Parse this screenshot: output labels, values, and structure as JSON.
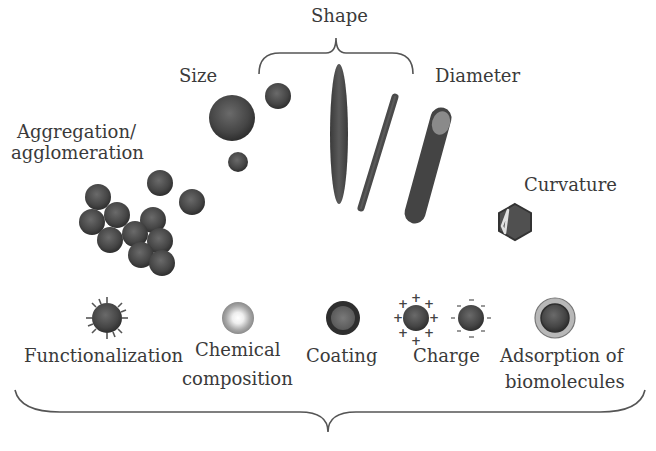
{
  "diagram": {
    "top_labels": {
      "shape": "Shape",
      "size": "Size",
      "diameter": "Diameter",
      "aggregation_line1": "Aggregation/",
      "aggregation_line2": "agglomeration",
      "curvature": "Curvature"
    },
    "bottom_labels": {
      "functionalization": "Functionalization",
      "chemical_line1": "Chemical",
      "chemical_line2": "composition",
      "coating": "Coating",
      "charge": "Charge",
      "adsorption_line1": "Adsorption of",
      "adsorption_line2": "biomolecules"
    },
    "charge_symbols": {
      "positive": "+",
      "negative": "-"
    },
    "colors": {
      "particle_dark": "#3c3c3c",
      "particle_mid": "#5a5a5a",
      "particle_light": "#8a8a8a",
      "brace": "#555555",
      "text": "#3a3a3a",
      "adsorption_ring": "#b0b0b0"
    }
  }
}
